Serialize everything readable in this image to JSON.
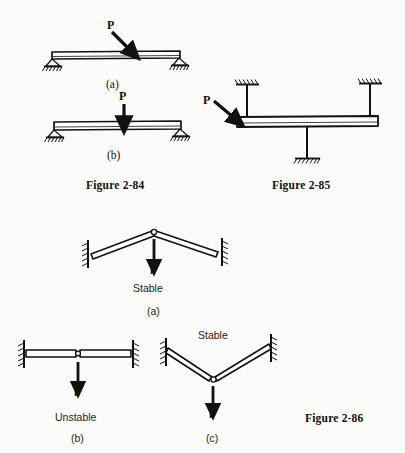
{
  "page": {
    "background_color": "#fbfbf9",
    "ink_color": "#111111",
    "width": 405,
    "height": 453
  },
  "figures": [
    {
      "id": "figure-2-84",
      "caption": "Figure 2-84",
      "subfigures": [
        {
          "id": "a",
          "label": "(a)",
          "load_label": "P",
          "load_direction": "inclined-down-right",
          "description": "simply supported beam with inclined point load"
        },
        {
          "id": "b",
          "label": "(b)",
          "load_label": "P",
          "load_direction": "vertical-down",
          "description": "simply supported beam with vertical point load"
        }
      ]
    },
    {
      "id": "figure-2-85",
      "caption": "Figure 2-85",
      "load_label": "P",
      "load_direction": "inclined-down-right",
      "description": "beam with two ceiling hangers and one bottom column support"
    },
    {
      "id": "figure-2-86",
      "caption": "Figure 2-86",
      "subfigures": [
        {
          "id": "a",
          "label": "(a)",
          "stability": "Stable",
          "load_label": "P",
          "description": "two-bar arch truss, apex above supports"
        },
        {
          "id": "b",
          "label": "(b)",
          "stability": "Unstable",
          "load_label": "P",
          "description": "two collinear horizontal bars pinned at center"
        },
        {
          "id": "c",
          "label": "(c)",
          "stability": "Stable",
          "load_label": "P",
          "description": "two-bar V truss, apex below supports"
        }
      ]
    }
  ],
  "labels": {
    "fig84_a_P": "P",
    "fig84_a_sub": "(a)",
    "fig84_b_P": "P",
    "fig84_b_sub": "(b)",
    "fig84_caption": "Figure 2-84",
    "fig85_P": "P",
    "fig85_caption": "Figure 2-85",
    "fig86_a_P": "P",
    "fig86_a_stability": "Stable",
    "fig86_a_sub": "(a)",
    "fig86_b_P": "P",
    "fig86_b_stability": "Unstable",
    "fig86_b_sub": "(b)",
    "fig86_c_P": "P",
    "fig86_c_stability": "Stable",
    "fig86_c_sub": "(c)",
    "fig86_caption": "Figure 2-86"
  }
}
